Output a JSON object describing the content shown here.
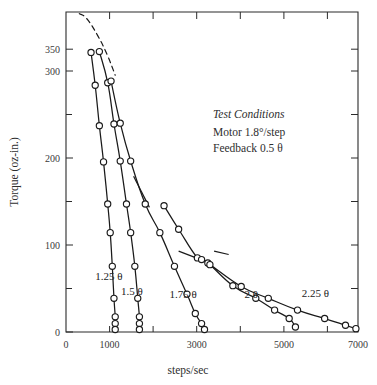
{
  "chart_data": {
    "type": "line",
    "title": "",
    "xlabel": "steps/sec",
    "ylabel": "Torque (oz-in.)",
    "xlim": [
      0,
      7000
    ],
    "ylim": [
      0,
      380
    ],
    "grid": false,
    "legend_position": "inline-annotations",
    "x_ticks_major": [
      0,
      1000,
      3000,
      5000,
      7000
    ],
    "x_ticks_minor": [
      2000,
      4000,
      6000
    ],
    "x_tick_labels": [
      "0",
      "1000",
      "3000",
      "5000",
      "7000"
    ],
    "y_ticks_major": [
      0,
      100,
      200,
      300,
      350
    ],
    "y_ticks_minor": [
      50,
      150,
      250
    ],
    "y_tick_labels": [
      "0",
      "100",
      "200",
      "300",
      "350"
    ],
    "annotations": {
      "title_line": "Test Conditions",
      "line2": "Motor 1.8°/step",
      "line3": "Feedback 0.5 θ"
    },
    "envelope": {
      "style": "dashed",
      "description": "pull-out torque envelope",
      "points": [
        [
          320,
          378
        ],
        [
          500,
          372
        ],
        [
          760,
          352
        ],
        [
          980,
          330
        ],
        [
          1180,
          305
        ]
      ]
    },
    "series": [
      {
        "name": "1.25 θ",
        "label": "1.25 θ",
        "label_x": 700,
        "label_y": 62,
        "points": [
          [
            600,
            332
          ],
          [
            700,
            293
          ],
          [
            800,
            245
          ],
          [
            900,
            202
          ],
          [
            1000,
            152
          ],
          [
            1060,
            118
          ],
          [
            1110,
            78
          ],
          [
            1150,
            40
          ],
          [
            1180,
            18
          ],
          [
            1180,
            10
          ],
          [
            1180,
            3
          ]
        ]
      },
      {
        "name": "1.5 θ",
        "label": "1.5 θ",
        "label_x": 1320,
        "label_y": 44,
        "points": [
          [
            800,
            333
          ],
          [
            1000,
            296
          ],
          [
            1150,
            247
          ],
          [
            1300,
            203
          ],
          [
            1450,
            152
          ],
          [
            1550,
            118
          ],
          [
            1650,
            78
          ],
          [
            1720,
            40
          ],
          [
            1760,
            18
          ],
          [
            1760,
            10
          ],
          [
            1760,
            3
          ]
        ]
      },
      {
        "name": "1.75 θ",
        "label": "1.75 θ",
        "label_x": 2480,
        "label_y": 40,
        "points": [
          [
            1080,
            298
          ],
          [
            1300,
            248
          ],
          [
            1550,
            203
          ],
          [
            1900,
            152
          ],
          [
            2250,
            118
          ],
          [
            2600,
            78
          ],
          [
            2900,
            45
          ],
          [
            3100,
            22
          ],
          [
            3250,
            10
          ],
          [
            3320,
            3
          ]
        ]
      },
      {
        "name": "2 θ",
        "label": "2 θ",
        "label_x": 4280,
        "label_y": 40,
        "points": [
          [
            2350,
            150
          ],
          [
            2700,
            122
          ],
          [
            3150,
            88
          ],
          [
            3400,
            82
          ],
          [
            4000,
            55
          ],
          [
            4550,
            40
          ],
          [
            5000,
            26
          ],
          [
            5350,
            16
          ],
          [
            5500,
            6
          ]
        ]
      },
      {
        "name": "2.25 θ",
        "label": "2.25 θ",
        "label_x": 5650,
        "label_y": 42,
        "points": [
          [
            3250,
            86
          ],
          [
            3450,
            80
          ],
          [
            4200,
            54
          ],
          [
            4850,
            40
          ],
          [
            5550,
            26
          ],
          [
            6200,
            16
          ],
          [
            6700,
            8
          ],
          [
            6950,
            4
          ]
        ]
      }
    ],
    "leaders": [
      {
        "name": "leader-1.75",
        "x1": 1620,
        "y1": 185,
        "x2": 2000,
        "y2": 148
      },
      {
        "name": "leader-2theta",
        "x1": 2700,
        "y1": 96,
        "x2": 3120,
        "y2": 88
      },
      {
        "name": "leader-2.25",
        "x1": 3550,
        "y1": 96,
        "x2": 3900,
        "y2": 92
      }
    ]
  }
}
